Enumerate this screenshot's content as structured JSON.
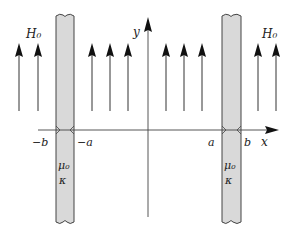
{
  "diagram": {
    "colors": {
      "line": "#333333",
      "slab_fill": "#d9d9d9",
      "slab_stroke": "#444444",
      "text": "#222222"
    },
    "axes": {
      "x_label": "x",
      "y_label": "y"
    },
    "field_label_left": "H₀",
    "field_label_right": "H₀",
    "tick_labels": {
      "neg_b": "−b",
      "neg_a": "−a",
      "a": "a",
      "b": "b"
    },
    "left_slab": {
      "mu_label": "μ₀",
      "kappa_label": "κ"
    },
    "right_slab": {
      "mu_label": "μ₀",
      "kappa_label": "κ"
    },
    "field_arrow_x": [
      19,
      38,
      92,
      110,
      128,
      166,
      184,
      202,
      258,
      276
    ]
  }
}
